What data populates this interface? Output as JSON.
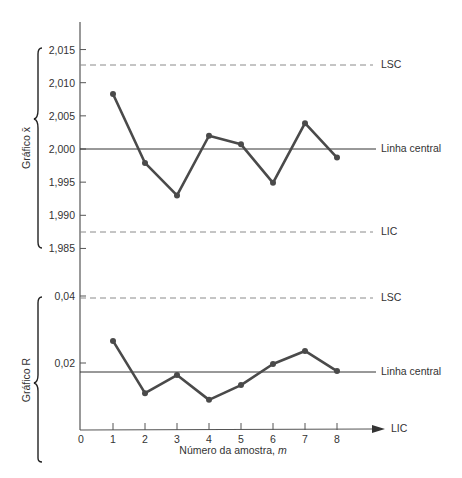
{
  "chart_data": [
    {
      "type": "line",
      "title": "Gráfico x̄",
      "ylabel": "Gráfico x̄",
      "xlabel": "Número da amostra, m",
      "x": [
        1,
        2,
        3,
        4,
        5,
        6,
        7,
        8
      ],
      "values": [
        2.0083,
        1.9979,
        1.993,
        2.002,
        2.0007,
        1.9949,
        2.0039,
        1.9987
      ],
      "yticks": [
        "2,015",
        "2,010",
        "2,005",
        "2,000",
        "1,995",
        "1,990",
        "1,985"
      ],
      "ylim": [
        1.985,
        2.015
      ],
      "control_lines": {
        "LSC": 2.0125,
        "Linha central": 2.0,
        "LIC": 1.9873
      },
      "grid": false
    },
    {
      "type": "line",
      "title": "Gráfico R",
      "ylabel": "Gráfico R",
      "xlabel": "Número da amostra, m",
      "x": [
        1,
        2,
        3,
        4,
        5,
        6,
        7,
        8
      ],
      "values": [
        0.0266,
        0.011,
        0.0164,
        0.009,
        0.0134,
        0.0197,
        0.0236,
        0.0176
      ],
      "yticks": [
        "0,04",
        "0,02"
      ],
      "ylim": [
        0,
        0.04
      ],
      "control_lines": {
        "LSC": 0.039,
        "Linha central": 0.0173,
        "LIC": 0
      },
      "grid": false
    }
  ],
  "labels": {
    "xbar_chart": "Gráfico x̄",
    "r_chart": "Gráfico R",
    "ucl": "LSC",
    "center": "Linha central",
    "lcl": "LIC",
    "x_axis_title": "Número da amostra, m",
    "x_axis_title_main": "Número da amostra, ",
    "x_axis_title_var": "m"
  },
  "x_ticks": [
    "0",
    "1",
    "2",
    "3",
    "4",
    "5",
    "6",
    "7",
    "8"
  ],
  "colors": {
    "data_line": "#4a4a4a",
    "axis": "#555555",
    "dashed": "#8a8a8a",
    "center": "#333333"
  }
}
